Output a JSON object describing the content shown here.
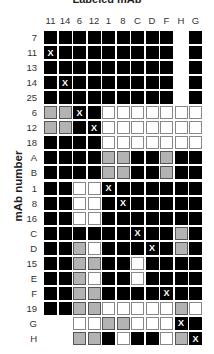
{
  "chart_data": {
    "type": "heatmap",
    "title": "Labeled mAb",
    "xlabel": "Labeled mAb",
    "ylabel": "mAb number",
    "columns": [
      "11",
      "14",
      "6",
      "12",
      "1",
      "8",
      "C",
      "D",
      "F",
      "H",
      "G"
    ],
    "rows": [
      "7",
      "11",
      "13",
      "14",
      "25",
      "6",
      "12",
      "18",
      "A",
      "B",
      "1",
      "8",
      "16",
      "C",
      "D",
      "15",
      "E",
      "F",
      "19",
      "G",
      "H"
    ],
    "legend": {
      "B": "black",
      "G": "gray",
      "W": "white",
      "-": "no data"
    },
    "cells": [
      [
        "B",
        "B",
        "B",
        "B",
        "B",
        "B",
        "B",
        "B",
        "B",
        "-",
        "B"
      ],
      [
        "BX",
        "B",
        "B",
        "B",
        "B",
        "B",
        "B",
        "B",
        "B",
        "-",
        "B"
      ],
      [
        "B",
        "B",
        "B",
        "B",
        "B",
        "B",
        "B",
        "B",
        "B",
        "-",
        "B"
      ],
      [
        "B",
        "BX",
        "B",
        "B",
        "B",
        "B",
        "B",
        "B",
        "B",
        "-",
        "B"
      ],
      [
        "B",
        "B",
        "B",
        "B",
        "B",
        "B",
        "B",
        "B",
        "B",
        "-",
        "B"
      ],
      [
        "G",
        "G",
        "BX",
        "B",
        "W",
        "W",
        "W",
        "W",
        "W",
        "W",
        "W"
      ],
      [
        "G",
        "G",
        "B",
        "BX",
        "W",
        "W",
        "W",
        "W",
        "W",
        "W",
        "W"
      ],
      [
        "B",
        "B",
        "B",
        "B",
        "W",
        "W",
        "W",
        "W",
        "W",
        "W",
        "W"
      ],
      [
        "B",
        "B",
        "B",
        "B",
        "G",
        "G",
        "B",
        "B",
        "G",
        "B",
        "B"
      ],
      [
        "B",
        "B",
        "B",
        "B",
        "G",
        "G",
        "B",
        "B",
        "G",
        "B",
        "B"
      ],
      [
        "B",
        "B",
        "W",
        "W",
        "BX",
        "B",
        "B",
        "B",
        "B",
        "B",
        "B"
      ],
      [
        "B",
        "B",
        "W",
        "W",
        "B",
        "BX",
        "B",
        "B",
        "B",
        "B",
        "B"
      ],
      [
        "B",
        "B",
        "W",
        "W",
        "B",
        "B",
        "B",
        "B",
        "B",
        "B",
        "B"
      ],
      [
        "B",
        "B",
        "B",
        "B",
        "B",
        "B",
        "BX",
        "B",
        "B",
        "G",
        "B"
      ],
      [
        "B",
        "B",
        "G",
        "W",
        "B",
        "B",
        "B",
        "BX",
        "B",
        "G",
        "B"
      ],
      [
        "B",
        "B",
        "G",
        "G",
        "B",
        "B",
        "W",
        "B",
        "B",
        "B",
        "B"
      ],
      [
        "B",
        "B",
        "G",
        "W",
        "B",
        "B",
        "W",
        "B",
        "B",
        "B",
        "B"
      ],
      [
        "B",
        "B",
        "G",
        "G",
        "B",
        "B",
        "B",
        "B",
        "BX",
        "B",
        "B"
      ],
      [
        "B",
        "B",
        "G",
        "G",
        "W",
        "W",
        "W",
        "W",
        "W",
        "G",
        "W"
      ],
      [
        "-",
        "-",
        "W",
        "W",
        "G",
        "G",
        "W",
        "W",
        "W",
        "BX",
        "B"
      ],
      [
        "-",
        "-",
        "G",
        "G",
        "B",
        "W",
        "B",
        "B",
        "W",
        "G",
        "BX"
      ]
    ],
    "mark": "X",
    "colors": {
      "black": "#000000",
      "gray": "#b3b3b3",
      "white": "#ffffff"
    }
  }
}
